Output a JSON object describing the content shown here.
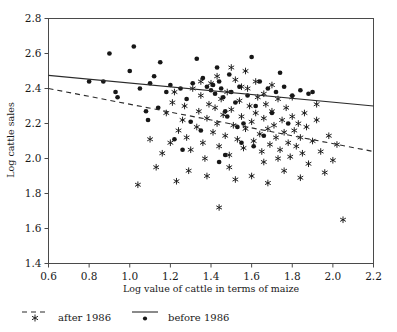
{
  "chart_data": {
    "type": "scatter",
    "title": "",
    "xlabel": "Log value of cattle in terms of maize",
    "ylabel": "Log cattle sales",
    "xlim": [
      0.6,
      2.2
    ],
    "ylim": [
      1.4,
      2.8
    ],
    "xticks": [
      "0.6",
      "0.8",
      "1.0",
      "1.2",
      "1.4",
      "1.6",
      "1.8",
      "2.0",
      "2.2"
    ],
    "yticks": [
      "1.4",
      "1.6",
      "1.8",
      "2.0",
      "2.2",
      "2.4",
      "2.6",
      "2.8"
    ],
    "grid": false,
    "legend_position": "below-axes-left",
    "series": [
      {
        "name": "after 1986",
        "marker": "asterisk",
        "line_style": "dashed",
        "color": "#171717",
        "points": [
          [
            1.04,
            1.85
          ],
          [
            1.13,
            1.95
          ],
          [
            1.23,
            1.87
          ],
          [
            1.29,
            1.93
          ],
          [
            1.1,
            2.11
          ],
          [
            1.16,
            2.03
          ],
          [
            1.2,
            2.09
          ],
          [
            1.24,
            2.16
          ],
          [
            1.18,
            2.26
          ],
          [
            1.21,
            2.32
          ],
          [
            1.26,
            2.22
          ],
          [
            1.28,
            2.12
          ],
          [
            1.3,
            2.05
          ],
          [
            1.33,
            2.18
          ],
          [
            1.34,
            2.27
          ],
          [
            1.35,
            2.36
          ],
          [
            1.36,
            2.09
          ],
          [
            1.37,
            2.0
          ],
          [
            1.38,
            2.23
          ],
          [
            1.39,
            2.31
          ],
          [
            1.4,
            2.43
          ],
          [
            1.41,
            2.15
          ],
          [
            1.42,
            2.29
          ],
          [
            1.43,
            2.2
          ],
          [
            1.44,
            2.07
          ],
          [
            1.45,
            2.34
          ],
          [
            1.46,
            2.25
          ],
          [
            1.47,
            2.13
          ],
          [
            1.48,
            2.38
          ],
          [
            1.49,
            2.02
          ],
          [
            1.5,
            2.28
          ],
          [
            1.51,
            2.19
          ],
          [
            1.52,
            2.45
          ],
          [
            1.53,
            2.11
          ],
          [
            1.54,
            2.33
          ],
          [
            1.55,
            2.24
          ],
          [
            1.56,
            2.06
          ],
          [
            1.57,
            2.17
          ],
          [
            1.58,
            2.4
          ],
          [
            1.59,
            2.3
          ],
          [
            1.6,
            2.21
          ],
          [
            1.61,
            2.1
          ],
          [
            1.62,
            2.26
          ],
          [
            1.63,
            2.35
          ],
          [
            1.64,
            2.14
          ],
          [
            1.65,
            2.04
          ],
          [
            1.66,
            2.23
          ],
          [
            1.67,
            2.31
          ],
          [
            1.68,
            2.17
          ],
          [
            1.69,
            2.08
          ],
          [
            1.7,
            2.27
          ],
          [
            1.71,
            2.19
          ],
          [
            1.72,
            2.12
          ],
          [
            1.73,
            2.34
          ],
          [
            1.74,
            2.05
          ],
          [
            1.75,
            2.22
          ],
          [
            1.76,
            2.15
          ],
          [
            1.77,
            2.29
          ],
          [
            1.78,
            2.09
          ],
          [
            1.79,
            2.01
          ],
          [
            1.8,
            2.24
          ],
          [
            1.81,
            2.16
          ],
          [
            1.82,
            2.07
          ],
          [
            1.83,
            2.2
          ],
          [
            1.84,
            2.12
          ],
          [
            1.85,
            2.03
          ],
          [
            1.86,
            2.26
          ],
          [
            1.87,
            2.18
          ],
          [
            1.88,
            1.97
          ],
          [
            1.9,
            2.1
          ],
          [
            1.92,
            2.22
          ],
          [
            1.94,
            2.04
          ],
          [
            1.96,
            1.92
          ],
          [
            1.98,
            2.13
          ],
          [
            2.0,
            1.99
          ],
          [
            2.02,
            2.08
          ],
          [
            2.05,
            1.65
          ],
          [
            1.44,
            1.72
          ],
          [
            1.52,
            1.88
          ],
          [
            1.6,
            1.9
          ],
          [
            1.68,
            1.86
          ],
          [
            1.76,
            1.93
          ],
          [
            1.84,
            1.89
          ],
          [
            1.31,
            2.4
          ],
          [
            1.43,
            2.47
          ],
          [
            1.55,
            2.41
          ],
          [
            1.5,
            2.52
          ],
          [
            1.57,
            2.5
          ],
          [
            1.62,
            2.44
          ],
          [
            1.66,
            2.37
          ],
          [
            1.22,
            2.38
          ],
          [
            1.27,
            2.3
          ],
          [
            1.35,
            2.44
          ],
          [
            1.7,
            2.42
          ],
          [
            1.8,
            2.35
          ],
          [
            1.92,
            2.31
          ],
          [
            1.73,
            2.0
          ],
          [
            1.66,
            1.98
          ],
          [
            1.49,
            1.95
          ],
          [
            1.38,
            1.9
          ]
        ]
      },
      {
        "name": "before 1986",
        "marker": "dot",
        "line_style": "solid",
        "color": "#171717",
        "points": [
          [
            0.8,
            2.44
          ],
          [
            0.87,
            2.44
          ],
          [
            0.9,
            2.6
          ],
          [
            0.93,
            2.38
          ],
          [
            0.94,
            2.35
          ],
          [
            1.0,
            2.5
          ],
          [
            1.02,
            2.64
          ],
          [
            1.08,
            2.27
          ],
          [
            1.09,
            2.22
          ],
          [
            1.12,
            2.47
          ],
          [
            1.15,
            2.55
          ],
          [
            1.18,
            2.38
          ],
          [
            1.22,
            2.11
          ],
          [
            1.25,
            2.4
          ],
          [
            1.28,
            2.34
          ],
          [
            1.31,
            2.43
          ],
          [
            1.33,
            2.57
          ],
          [
            1.36,
            2.46
          ],
          [
            1.38,
            2.41
          ],
          [
            1.4,
            2.39
          ],
          [
            1.41,
            2.42
          ],
          [
            1.42,
            2.37
          ],
          [
            1.43,
            2.52
          ],
          [
            1.44,
            2.44
          ],
          [
            1.45,
            2.4
          ],
          [
            1.46,
            2.35
          ],
          [
            1.47,
            2.27
          ],
          [
            1.48,
            2.24
          ],
          [
            1.49,
            2.48
          ],
          [
            1.5,
            2.38
          ],
          [
            1.52,
            2.32
          ],
          [
            1.54,
            2.41
          ],
          [
            1.56,
            2.2
          ],
          [
            1.58,
            2.36
          ],
          [
            1.6,
            2.58
          ],
          [
            1.62,
            2.3
          ],
          [
            1.64,
            2.44
          ],
          [
            1.66,
            2.13
          ],
          [
            1.68,
            2.4
          ],
          [
            1.7,
            2.26
          ],
          [
            1.72,
            2.38
          ],
          [
            1.74,
            2.49
          ],
          [
            1.76,
            2.41
          ],
          [
            1.78,
            2.2
          ],
          [
            1.8,
            2.36
          ],
          [
            1.84,
            2.39
          ],
          [
            1.88,
            2.37
          ],
          [
            1.9,
            2.38
          ],
          [
            1.3,
            2.21
          ],
          [
            1.35,
            2.16
          ],
          [
            1.26,
            2.05
          ],
          [
            1.47,
            2.02
          ],
          [
            1.55,
            2.09
          ],
          [
            1.2,
            2.42
          ],
          [
            1.1,
            2.43
          ],
          [
            1.05,
            2.4
          ],
          [
            1.14,
            2.29
          ],
          [
            1.53,
            2.18
          ],
          [
            1.61,
            2.07
          ],
          [
            1.44,
            1.98
          ]
        ]
      }
    ],
    "fits": [
      {
        "name": "before 1986",
        "style": "solid",
        "x0": 0.6,
        "y0": 2.475,
        "x1": 2.2,
        "y1": 2.3
      },
      {
        "name": "after 1986",
        "style": "dashed",
        "x0": 0.6,
        "y0": 2.4,
        "x1": 2.2,
        "y1": 2.04
      }
    ]
  },
  "legend": {
    "items": [
      {
        "label": "after 1986",
        "marker": "asterisk-icon",
        "line": "dashed"
      },
      {
        "label": "before 1986",
        "marker": "dot-icon",
        "line": "solid"
      }
    ]
  }
}
